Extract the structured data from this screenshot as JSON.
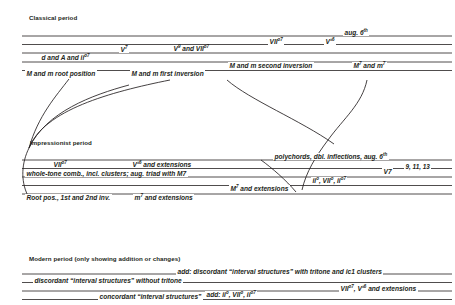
{
  "diagram": {
    "title_hidden": "Harmonic vocabulary by historical period",
    "ink_color": "#231f20",
    "background": "#ffffff"
  },
  "sections": [
    {
      "id": "classical",
      "title": "Classical period",
      "labels": [
        {
          "id": "aug6",
          "text": "aug. 6th"
        },
        {
          "id": "vii-dim7",
          "text": "VII°7"
        },
        {
          "id": "v-flat6",
          "text": "V♭6"
        },
        {
          "id": "v7",
          "text": "V7"
        },
        {
          "id": "v9-vii-dim7",
          "text": "V9 and VII°7"
        },
        {
          "id": "d-A-ii-dim7",
          "text": "d and A and ii°7"
        },
        {
          "id": "M7-m7",
          "text": "M7 and m7"
        },
        {
          "id": "root-position",
          "text": "M and m root position"
        },
        {
          "id": "first-inversion",
          "text": "M and m first inversion"
        },
        {
          "id": "second-inversion",
          "text": "M and m second inversion"
        }
      ]
    },
    {
      "id": "impressionist",
      "title": "Impressionist period",
      "labels": [
        {
          "id": "polychords",
          "text": "polychords, dbl. inflections, aug. 6th"
        },
        {
          "id": "imp-vii-dim7",
          "text": "VII°7"
        },
        {
          "id": "imp-v-flat6-ext",
          "text": "V♭6 and extensions"
        },
        {
          "id": "imp-v7",
          "text": "V7"
        },
        {
          "id": "imp-ext-numbers",
          "text": "9, 11, 13"
        },
        {
          "id": "whole-tone",
          "text": "whole-tone comb., incl. clusters; aug. triad with M7"
        },
        {
          "id": "imp-ii-vii-ii7",
          "text": "ii°, VII°, ii°7"
        },
        {
          "id": "imp-M7-ext",
          "text": "M7 and extensions"
        },
        {
          "id": "imp-m7-ext",
          "text": "m7 and extensions"
        },
        {
          "id": "root-1st-2nd",
          "text": "Root pos., 1st and 2nd inv."
        }
      ]
    },
    {
      "id": "modern",
      "title": "Modern period (only showing addition or changes)",
      "labels": [
        {
          "id": "mod-add-discordant",
          "text_prefix": "add:",
          "text": "discordant “interval structures” with tritone and ic1 clusters"
        },
        {
          "id": "mod-discordant",
          "text": "discordant “interval structures” without tritone"
        },
        {
          "id": "mod-vii-v-ext",
          "text": "VII°7, V♭6 and extensions"
        },
        {
          "id": "mod-concordant",
          "text": "concordant “interval structures”"
        },
        {
          "id": "mod-add-ii",
          "text_prefix": "add:",
          "text": "ii°, VII°, ii°7"
        }
      ]
    }
  ]
}
